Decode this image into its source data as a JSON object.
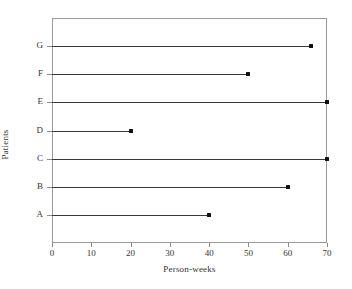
{
  "chart_data": {
    "type": "bar",
    "subtype": "horizontal-lollipop",
    "title": "",
    "subtitle": "",
    "xlabel": "Person-weeks",
    "ylabel": "Patients",
    "categories": [
      "A",
      "B",
      "C",
      "D",
      "E",
      "F",
      "G"
    ],
    "values": [
      40,
      60,
      70,
      20,
      70,
      50,
      66
    ],
    "points": [
      {
        "category": "A",
        "value": 40
      },
      {
        "category": "B",
        "value": 60
      },
      {
        "category": "C",
        "value": 70
      },
      {
        "category": "D",
        "value": 20
      },
      {
        "category": "E",
        "value": 70
      },
      {
        "category": "F",
        "value": 50
      },
      {
        "category": "G",
        "value": 66
      }
    ],
    "category_order_top_to_bottom": [
      "G",
      "F",
      "E",
      "D",
      "C",
      "B",
      "A"
    ],
    "xlim": [
      0,
      70
    ],
    "xticks": [
      0,
      10,
      20,
      30,
      40,
      50,
      60,
      70
    ],
    "xtick_labels": [
      "0",
      "10",
      "20",
      "30",
      "40",
      "50",
      "60",
      "70"
    ],
    "ytick_labels": [
      "G",
      "F",
      "E",
      "D",
      "C",
      "B",
      "A"
    ],
    "grid": false,
    "legend": false,
    "legend_position": "none",
    "colors": {
      "stem": "#3a3a3a",
      "marker": "#111111",
      "frame": "#999999",
      "text": "#333333",
      "background": "#ffffff"
    }
  }
}
